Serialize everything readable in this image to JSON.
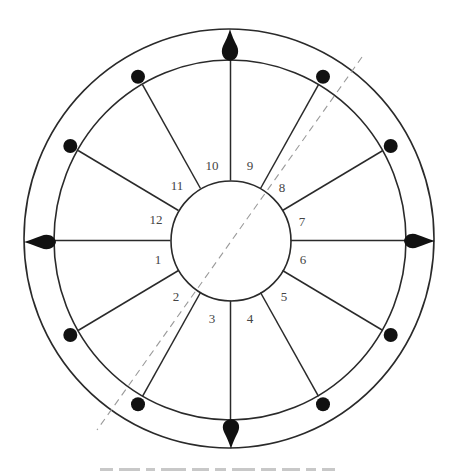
{
  "diagram": {
    "type": "house-wheel",
    "center": {
      "x": 230,
      "y": 240
    },
    "outer_ring": {
      "rx": 205,
      "ry": 210
    },
    "middle_ring": {
      "rx": 176,
      "ry": 180
    },
    "inner_circle": {
      "r": 60
    },
    "colors": {
      "line": "#2a2a2a",
      "marker": "#111111",
      "axis_dashed": "#9a9a9a",
      "label": "#444444"
    },
    "houses": [
      {
        "number": "1",
        "x": 158,
        "y": 259
      },
      {
        "number": "2",
        "x": 176,
        "y": 296
      },
      {
        "number": "3",
        "x": 212,
        "y": 318
      },
      {
        "number": "4",
        "x": 250,
        "y": 318
      },
      {
        "number": "5",
        "x": 284,
        "y": 296
      },
      {
        "number": "6",
        "x": 303,
        "y": 259
      },
      {
        "number": "7",
        "x": 302,
        "y": 221
      },
      {
        "number": "8",
        "x": 282,
        "y": 187
      },
      {
        "number": "9",
        "x": 250,
        "y": 165
      },
      {
        "number": "10",
        "x": 212,
        "y": 165
      },
      {
        "number": "11",
        "x": 177,
        "y": 185
      },
      {
        "number": "12",
        "x": 156,
        "y": 219
      }
    ],
    "cardinal_markers": [
      "top-spike",
      "right-spike",
      "bottom-spike",
      "left-spike"
    ],
    "dot_markers_count": 8,
    "dashed_axis": {
      "from": {
        "x": 362,
        "y": 57
      },
      "to": {
        "x": 97,
        "y": 430
      }
    }
  },
  "caption": {
    "visible": "clipped",
    "text": ""
  }
}
